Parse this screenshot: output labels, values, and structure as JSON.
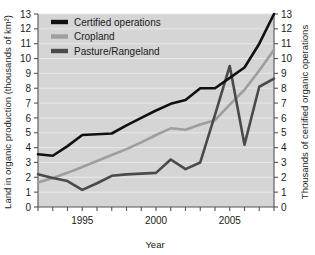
{
  "chart_data": {
    "type": "line",
    "title": "",
    "xlabel": "Year",
    "ylabel": "Land in organic production (thousands of km²)",
    "y2label": "Thousands of certified organic operations",
    "xlim": [
      1992,
      2008
    ],
    "ylim": [
      0,
      13
    ],
    "y2lim": [
      0,
      13
    ],
    "grid": true,
    "legend_position": "top-left",
    "x": [
      1992,
      1993,
      1994,
      1995,
      1996,
      1997,
      1998,
      1999,
      2000,
      2001,
      2002,
      2003,
      2004,
      2005,
      2006,
      2007,
      2008
    ],
    "xticks_major": [
      1995,
      2000,
      2005
    ],
    "xtick_labels": [
      "1995",
      "2000",
      "2005"
    ],
    "yticks": [
      0,
      1,
      2,
      3,
      4,
      5,
      6,
      7,
      8,
      9,
      10,
      11,
      12,
      13
    ],
    "ytick_labels": [
      "0",
      "1",
      "2",
      "3",
      "4",
      "5",
      "6",
      "7",
      "8",
      "9",
      "10",
      "11",
      "12",
      "13"
    ],
    "y2ticks": [
      0,
      1,
      2,
      3,
      4,
      5,
      6,
      7,
      8,
      9,
      10,
      11,
      12,
      13
    ],
    "y2tick_labels": [
      "0",
      "1",
      "2",
      "3",
      "4",
      "5",
      "6",
      "7",
      "8",
      "9",
      "10",
      "11",
      "12",
      "13"
    ],
    "series": [
      {
        "name": "Certified operations",
        "axis": "right",
        "color": "#111111",
        "values": [
          3.55,
          3.45,
          4.1,
          4.85,
          4.9,
          4.95,
          5.5,
          6.0,
          6.5,
          6.95,
          7.2,
          8.0,
          8.0,
          8.7,
          9.4,
          11.0,
          13.0
        ]
      },
      {
        "name": "Cropland",
        "axis": "left",
        "color": "#9e9e9e",
        "values": [
          1.65,
          1.95,
          2.3,
          2.7,
          3.1,
          3.5,
          3.9,
          4.35,
          4.85,
          5.3,
          5.2,
          5.55,
          5.85,
          6.9,
          7.9,
          9.2,
          10.6
        ]
      },
      {
        "name": "Pasture/Rangeland",
        "axis": "left",
        "color": "#4a4a4a",
        "values": [
          2.2,
          1.95,
          1.75,
          1.15,
          1.6,
          2.1,
          2.2,
          2.25,
          2.3,
          3.2,
          2.55,
          3.0,
          6.2,
          9.5,
          4.2,
          8.1,
          8.65
        ]
      }
    ]
  },
  "legend": {
    "items": [
      {
        "label": "Certified operations"
      },
      {
        "label": "Cropland"
      },
      {
        "label": "Pasture/Rangeland"
      }
    ]
  },
  "style": {
    "plot_background": "#d5d5d5",
    "gridline_color": "#e8e8e8",
    "axis_color": "#555555",
    "text_color": "#1a1a1a"
  }
}
